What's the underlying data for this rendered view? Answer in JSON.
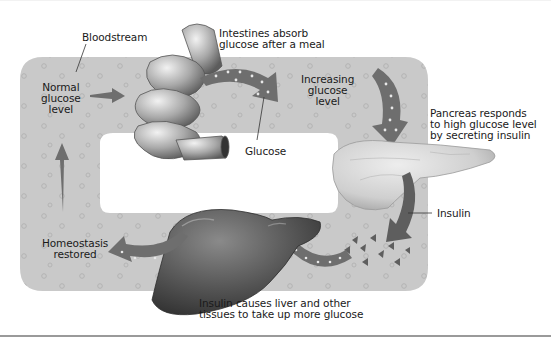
{
  "diagram": {
    "colors": {
      "bloodstream": "#c9c9c9",
      "bubble": "#b5b5b5",
      "arrow": "#6e6e6e",
      "arrow_dots": "#e8e8e8",
      "organ_dark": "#5a5a5a",
      "pancreas": "#d8d8d8",
      "background": "#ffffff",
      "text": "#1a1a1a"
    },
    "labels": {
      "bloodstream": "Bloodstream",
      "intestines": "Intestines absorb\nglucose after a meal",
      "normal_glucose": "Normal\nglucose\nlevel",
      "glucose": "Glucose",
      "increasing_glucose": "Increasing\nglucose\nlevel",
      "pancreas": "Pancreas responds\nto high glucose level\nby secreting insulin",
      "insulin": "Insulin",
      "homeostasis": "Homeostasis\nrestored",
      "liver": "Insulin causes liver and other\ntissues to take up more glucose"
    },
    "organs": [
      "small-intestine",
      "pancreas",
      "liver"
    ],
    "flow": [
      "Normal glucose level",
      "Intestines absorb glucose after a meal",
      "Increasing glucose level",
      "Pancreas responds to high glucose level by secreting insulin",
      "Insulin causes liver and other tissues to take up more glucose",
      "Homeostasis restored"
    ]
  }
}
